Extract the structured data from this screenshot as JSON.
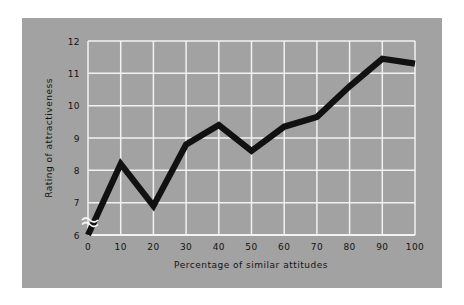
{
  "figure": {
    "panel_color": "#a2a2a2",
    "background_color": "#ffffff",
    "grid_color": "#f2f2f2",
    "line_color": "#111111",
    "text_color": "#141414"
  },
  "chart_data": {
    "type": "line",
    "title": "",
    "xlabel": "Percentage of similar attitudes",
    "ylabel": "Rating of attractiveness",
    "x": [
      0,
      10,
      20,
      30,
      40,
      50,
      60,
      70,
      80,
      90,
      100
    ],
    "values": [
      6.0,
      8.2,
      6.9,
      8.8,
      9.4,
      8.6,
      9.35,
      9.65,
      10.6,
      11.45,
      11.3
    ],
    "xticklabels": [
      "0",
      "10",
      "20",
      "30",
      "40",
      "50",
      "60",
      "70",
      "80",
      "90",
      "100"
    ],
    "yticklabels": [
      "6",
      "7",
      "8",
      "9",
      "10",
      "11",
      "12"
    ],
    "yticks": [
      6,
      7,
      8,
      9,
      10,
      11,
      12
    ],
    "xlim": [
      0,
      100
    ],
    "ylim": [
      6,
      12
    ],
    "grid": true,
    "legend": null,
    "axis_break": {
      "axis": "y",
      "symbol": "wavy-break",
      "below_value": "6"
    }
  }
}
